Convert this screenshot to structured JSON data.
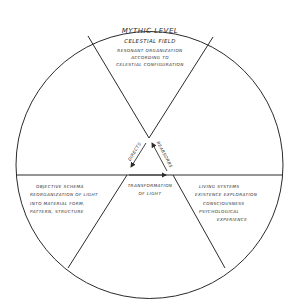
{
  "diagram": {
    "top_sector": {
      "title": "MYTHIC LEVEL",
      "subtitle": "CELESTIAL FIELD",
      "lines": [
        "RESONANT ORGANIZATION",
        "ACCORDING TO",
        "CELESTIAL CONFIGURATION"
      ]
    },
    "left_sector": {
      "lines": [
        "OBJECTIVE SCHEMA",
        "REORGANIZATION OF LIGHT",
        "INTO MATERIAL FORM,",
        "PATTERN, STRUCTURE"
      ]
    },
    "center_sector": {
      "lines": [
        "TRANSFORMATION",
        "OF LIGHT"
      ]
    },
    "right_sector": {
      "lines": [
        "LIVING SYSTEMS",
        "EXISTENCE EXPLORATION",
        "CONSCIOUSNESS",
        "PSYCHOLOGICAL",
        "EXPERIENCE"
      ]
    },
    "arrows": {
      "left_label": "DIRECTS",
      "right_label": "REABSORBS"
    },
    "colors": {
      "line": "#2b2b2b",
      "background": "#ffffff"
    }
  }
}
